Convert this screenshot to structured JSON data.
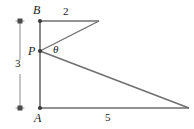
{
  "figure": {
    "type": "geometry-diagram",
    "width": 194,
    "height": 129,
    "stroke_color": "#6e6e6e",
    "text_color": "#1a1a1a",
    "background": "#ffffff"
  },
  "vertices": {
    "B": {
      "label": "B",
      "x": 40,
      "y": 21
    },
    "P": {
      "label": "P",
      "x": 40,
      "y": 51
    },
    "A": {
      "label": "A",
      "x": 40,
      "y": 108
    },
    "top_right": {
      "label": "",
      "x": 99,
      "y": 21
    },
    "bottom_right": {
      "label": "",
      "x": 189,
      "y": 108
    }
  },
  "labels": {
    "vertex_b": "B",
    "vertex_p": "P",
    "vertex_a": "A",
    "top_length": "2",
    "bottom_length": "5",
    "left_length": "3",
    "angle": "θ"
  },
  "segments": [
    {
      "name": "segment-AB",
      "from": "A",
      "to": "B"
    },
    {
      "name": "segment-B-topright",
      "from": "B",
      "to": "top_right"
    },
    {
      "name": "segment-P-topright",
      "from": "P",
      "to": "top_right"
    },
    {
      "name": "segment-P-bottomright",
      "from": "P",
      "to": "bottom_right"
    },
    {
      "name": "segment-A-bottomright",
      "from": "A",
      "to": "bottom_right"
    }
  ],
  "measure_bar": {
    "name": "length-3-bracket",
    "x": 20,
    "y_top": 21,
    "y_bottom": 108,
    "value": "3"
  }
}
